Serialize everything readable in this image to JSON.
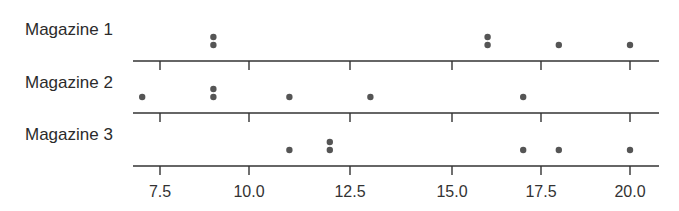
{
  "chart_data": {
    "type": "scatter",
    "subtype": "dot-plot",
    "title": "",
    "xlabel": "",
    "ylabel": "",
    "xlim": [
      6.8,
      21.2
    ],
    "x_ticks": [
      7.5,
      10.0,
      12.5,
      15.0,
      17.5,
      20.0
    ],
    "x_tick_labels": [
      "7.5",
      "10.0",
      "12.5",
      "15.0",
      "17.5",
      "20.0"
    ],
    "grid": false,
    "legend": null,
    "series": [
      {
        "name": "Magazine 1",
        "values": [
          9,
          9,
          16,
          16,
          18,
          20
        ]
      },
      {
        "name": "Magazine 2",
        "values": [
          7,
          9,
          9,
          11,
          13,
          17
        ]
      },
      {
        "name": "Magazine 3",
        "values": [
          11,
          12,
          12,
          17,
          18,
          20
        ]
      }
    ]
  },
  "labels": {
    "row1": "Magazine 1",
    "row2": "Magazine 2",
    "row3": "Magazine 3"
  },
  "colors": {
    "dot": "#555555",
    "axis": "#333333",
    "text": "#2b2b2b"
  }
}
